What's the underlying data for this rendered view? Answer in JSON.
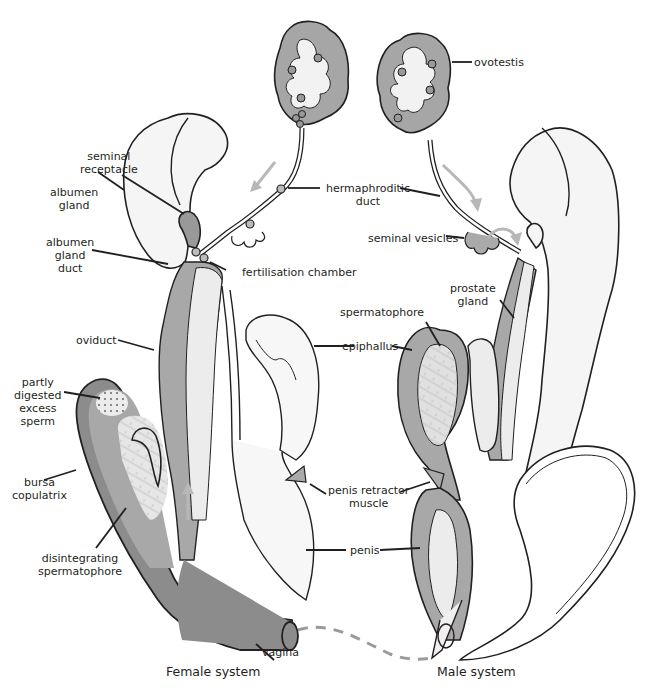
{
  "diagram": {
    "type": "anatomical-diagram",
    "colors": {
      "outline": "#231f20",
      "dark_fill": "#8c8c8c",
      "mid_fill": "#b3b3b3",
      "light_fill": "#f2f2f2",
      "arrow": "#b8b8b8",
      "dashed_line": "#9a9a9a"
    },
    "captions": {
      "female": "Female system",
      "male": "Male system"
    },
    "labels": {
      "seminal_receptacle": [
        "seminal",
        "receptacle"
      ],
      "albumen_gland": [
        "albumen",
        "gland"
      ],
      "albumen_gland_duct": [
        "albumen",
        "gland",
        "duct"
      ],
      "fertilisation_chamber": "fertilisation chamber",
      "hermaphroditic_duct": [
        "hermaphroditic",
        "duct"
      ],
      "ovotestis": "ovotestis",
      "seminal_vesicles": "seminal vesicles",
      "prostate_gland": [
        "prostate",
        "gland"
      ],
      "spermatophore": "spermatophore",
      "epiphallus": "epiphallus",
      "oviduct": "oviduct",
      "partly_digested_excess_sperm": [
        "partly",
        "digested",
        "excess",
        "sperm"
      ],
      "bursa_copulatrix": [
        "bursa",
        "copulatrix"
      ],
      "disintegrating_spermatophore": [
        "disintegrating",
        "spermatophore"
      ],
      "penis_retractor_muscle": [
        "penis retractor",
        "muscle"
      ],
      "penis": "penis",
      "vagina": "vagina"
    }
  }
}
